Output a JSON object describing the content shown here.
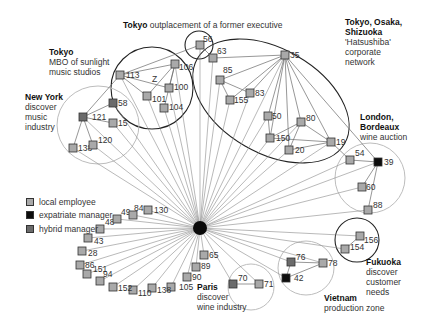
{
  "colors": {
    "local_employee": "#a9a9a9",
    "expatriate_manager": "#0d0d0d",
    "hybrid_manager": "#6b6b6b",
    "edge": "#8a8a8a",
    "region_dark": "#222222",
    "region_light": "#bdbdbd"
  },
  "legend": {
    "items": [
      {
        "type": "local",
        "label": "local employee"
      },
      {
        "type": "expat",
        "label": "expatriate manager"
      },
      {
        "type": "hybrid",
        "label": "hybrid manager"
      }
    ]
  },
  "annotations": {
    "tokyo_outplacement": {
      "place": "Tokyo",
      "text": "outplacement of a former executive"
    },
    "tokyo_mbo": {
      "place": "Tokyo",
      "line1": "MBO of sunlight",
      "line2": "music studios"
    },
    "new_york": {
      "place": "New York",
      "line1": "discover",
      "line2": "music",
      "line3": "industry"
    },
    "hatsushiba": {
      "place_line1": "Tokyo, Osaka,",
      "place_line2": "Shizuoka",
      "line1": "'Hatsushiba'",
      "line2": "corporate",
      "line3": "network"
    },
    "london": {
      "place_line1": "London,",
      "place_line2": "Bordeaux",
      "line1": "wine auction"
    },
    "fukuoka": {
      "place": "Fukuoka",
      "line1": "discover",
      "line2": "customer",
      "line3": "needs"
    },
    "paris": {
      "place": "Paris",
      "line1": "discover",
      "line2": "wine industry"
    },
    "vietnam": {
      "place": "Vietnam",
      "line1": "production zone"
    },
    "cluster_z_label": "Z"
  },
  "hub": {
    "x": 200,
    "y": 228,
    "r": 7
  },
  "regions": [
    {
      "name": "tokyo-outplacement",
      "cx": 199,
      "cy": 45,
      "rx": 14,
      "ry": 14,
      "style": "dark"
    },
    {
      "name": "tokyo-mbo",
      "cx": 152,
      "cy": 88,
      "rx": 41,
      "ry": 41,
      "style": "dark"
    },
    {
      "name": "new-york",
      "cx": 98,
      "cy": 125,
      "rx": 41,
      "ry": 39,
      "style": "light"
    },
    {
      "name": "hatsushiba",
      "cx": 271,
      "cy": 101,
      "rx": 85,
      "ry": 52,
      "rot": 30,
      "style": "dark"
    },
    {
      "name": "london-bordeaux",
      "cx": 370,
      "cy": 178,
      "rx": 35,
      "ry": 35,
      "style": "light"
    },
    {
      "name": "fukuoka",
      "cx": 357,
      "cy": 240,
      "rx": 22,
      "ry": 22,
      "style": "dark"
    },
    {
      "name": "vietnam",
      "cx": 306,
      "cy": 268,
      "rx": 28,
      "ry": 27,
      "style": "light"
    },
    {
      "name": "paris",
      "cx": 251,
      "cy": 287,
      "rx": 23,
      "ry": 23,
      "style": "light"
    }
  ],
  "nodes": [
    {
      "id": "56",
      "x": 200,
      "y": 45,
      "type": "local",
      "lx": 3,
      "ly": -3
    },
    {
      "id": "113",
      "x": 120,
      "y": 75,
      "type": "local",
      "lx": 6,
      "ly": 0
    },
    {
      "id": "106",
      "x": 175,
      "y": 64,
      "type": "local",
      "lx": 4,
      "ly": 6
    },
    {
      "id": "100",
      "x": 169,
      "y": 88,
      "type": "local",
      "lx": 5,
      "ly": 2
    },
    {
      "id": "101",
      "x": 147,
      "y": 96,
      "type": "local",
      "lx": 5,
      "ly": 6
    },
    {
      "id": "104",
      "x": 164,
      "y": 108,
      "type": "local",
      "lx": 5,
      "ly": 2
    },
    {
      "id": "58",
      "x": 113,
      "y": 103,
      "type": "hybrid",
      "lx": 5,
      "ly": 3
    },
    {
      "id": "121",
      "x": 83,
      "y": 117,
      "type": "hybrid",
      "lx": 9,
      "ly": 3
    },
    {
      "id": "15",
      "x": 113,
      "y": 123,
      "type": "local",
      "lx": 5,
      "ly": 3
    },
    {
      "id": "138",
      "x": 73,
      "y": 148,
      "type": "local",
      "lx": 5,
      "ly": 3
    },
    {
      "id": "120",
      "x": 93,
      "y": 145,
      "type": "local",
      "lx": 5,
      "ly": -2
    },
    {
      "id": "63",
      "x": 213,
      "y": 58,
      "type": "local",
      "lx": 4,
      "ly": -4
    },
    {
      "id": "35",
      "x": 285,
      "y": 55,
      "type": "local",
      "lx": 5,
      "ly": 3
    },
    {
      "id": "85",
      "x": 220,
      "y": 80,
      "type": "local",
      "lx": 3,
      "ly": -7
    },
    {
      "id": "83",
      "x": 250,
      "y": 93,
      "type": "local",
      "lx": 5,
      "ly": 3
    },
    {
      "id": "155",
      "x": 230,
      "y": 100,
      "type": "local",
      "lx": 4,
      "ly": 3
    },
    {
      "id": "50",
      "x": 268,
      "y": 116,
      "type": "local",
      "lx": 4,
      "ly": 3
    },
    {
      "id": "80",
      "x": 301,
      "y": 122,
      "type": "local",
      "lx": 5,
      "ly": -1
    },
    {
      "id": "150",
      "x": 270,
      "y": 138,
      "type": "local",
      "lx": 6,
      "ly": 3
    },
    {
      "id": "20",
      "x": 289,
      "y": 150,
      "type": "local",
      "lx": 6,
      "ly": 3
    },
    {
      "id": "19",
      "x": 331,
      "y": 142,
      "type": "local",
      "lx": 5,
      "ly": 0
    },
    {
      "id": "54",
      "x": 350,
      "y": 160,
      "type": "local",
      "lx": 5,
      "ly": -4
    },
    {
      "id": "39",
      "x": 378,
      "y": 162,
      "type": "expat",
      "lx": 6,
      "ly": 0
    },
    {
      "id": "60",
      "x": 362,
      "y": 187,
      "type": "local",
      "lx": 4,
      "ly": 0
    },
    {
      "id": "88",
      "x": 368,
      "y": 210,
      "type": "local",
      "lx": 5,
      "ly": -2
    },
    {
      "id": "156",
      "x": 360,
      "y": 236,
      "type": "local",
      "lx": 4,
      "ly": 7
    },
    {
      "id": "154",
      "x": 345,
      "y": 249,
      "type": "local",
      "lx": 5,
      "ly": 1
    },
    {
      "id": "76",
      "x": 291,
      "y": 262,
      "type": "hybrid",
      "lx": 5,
      "ly": -2
    },
    {
      "id": "78",
      "x": 323,
      "y": 263,
      "type": "local",
      "lx": 5,
      "ly": 3
    },
    {
      "id": "42",
      "x": 286,
      "y": 278,
      "type": "expat",
      "lx": 8,
      "ly": 3
    },
    {
      "id": "70",
      "x": 233,
      "y": 284,
      "type": "hybrid",
      "lx": 5,
      "ly": -3
    },
    {
      "id": "71",
      "x": 259,
      "y": 284,
      "type": "local",
      "lx": 5,
      "ly": 0
    },
    {
      "id": "65",
      "x": 204,
      "y": 255,
      "type": "local",
      "lx": 5,
      "ly": 3
    },
    {
      "id": "89",
      "x": 196,
      "y": 267,
      "type": "local",
      "lx": 5,
      "ly": 2
    },
    {
      "id": "90",
      "x": 187,
      "y": 277,
      "type": "local",
      "lx": 5,
      "ly": 3
    },
    {
      "id": "105",
      "x": 171,
      "y": 287,
      "type": "local",
      "lx": 8,
      "ly": 3
    },
    {
      "id": "138b",
      "label": "138",
      "x": 152,
      "y": 288,
      "type": "local",
      "lx": 5,
      "ly": 5
    },
    {
      "id": "110",
      "x": 133,
      "y": 290,
      "type": "local",
      "lx": 5,
      "ly": 6
    },
    {
      "id": "152",
      "x": 113,
      "y": 287,
      "type": "local",
      "lx": 5,
      "ly": 4
    },
    {
      "id": "94",
      "x": 100,
      "y": 281,
      "type": "local",
      "lx": 3,
      "ly": -4
    },
    {
      "id": "151",
      "x": 87,
      "y": 274,
      "type": "local",
      "lx": 6,
      "ly": -2
    },
    {
      "id": "86",
      "x": 80,
      "y": 265,
      "type": "local",
      "lx": 5,
      "ly": 0
    },
    {
      "id": "28",
      "x": 82,
      "y": 251,
      "type": "local",
      "lx": 6,
      "ly": 5
    },
    {
      "id": "43",
      "x": 88,
      "y": 238,
      "type": "local",
      "lx": 6,
      "ly": 6
    },
    {
      "id": "48",
      "x": 100,
      "y": 229,
      "type": "local",
      "lx": 5,
      "ly": -4
    },
    {
      "id": "49",
      "x": 117,
      "y": 219,
      "type": "local",
      "lx": 4,
      "ly": -4
    },
    {
      "id": "84",
      "x": 133,
      "y": 215,
      "type": "local",
      "lx": 1,
      "ly": -4
    },
    {
      "id": "130",
      "x": 148,
      "y": 210,
      "type": "local",
      "lx": 6,
      "ly": 0
    }
  ],
  "edges": [
    [
      "hub",
      "56"
    ],
    [
      "hub",
      "113"
    ],
    [
      "hub",
      "106"
    ],
    [
      "hub",
      "100"
    ],
    [
      "hub",
      "101"
    ],
    [
      "hub",
      "104"
    ],
    [
      "hub",
      "58"
    ],
    [
      "hub",
      "121"
    ],
    [
      "hub",
      "15"
    ],
    [
      "hub",
      "138"
    ],
    [
      "hub",
      "120"
    ],
    [
      "hub",
      "63"
    ],
    [
      "hub",
      "35"
    ],
    [
      "hub",
      "85"
    ],
    [
      "hub",
      "83"
    ],
    [
      "hub",
      "155"
    ],
    [
      "hub",
      "50"
    ],
    [
      "hub",
      "80"
    ],
    [
      "hub",
      "150"
    ],
    [
      "hub",
      "20"
    ],
    [
      "hub",
      "19"
    ],
    [
      "hub",
      "54"
    ],
    [
      "hub",
      "39"
    ],
    [
      "hub",
      "60"
    ],
    [
      "hub",
      "88"
    ],
    [
      "hub",
      "156"
    ],
    [
      "hub",
      "154"
    ],
    [
      "hub",
      "76"
    ],
    [
      "hub",
      "78"
    ],
    [
      "hub",
      "42"
    ],
    [
      "hub",
      "70"
    ],
    [
      "hub",
      "71"
    ],
    [
      "hub",
      "65"
    ],
    [
      "hub",
      "89"
    ],
    [
      "hub",
      "90"
    ],
    [
      "hub",
      "105"
    ],
    [
      "hub",
      "138b"
    ],
    [
      "hub",
      "110"
    ],
    [
      "hub",
      "152"
    ],
    [
      "hub",
      "94"
    ],
    [
      "hub",
      "151"
    ],
    [
      "hub",
      "86"
    ],
    [
      "hub",
      "28"
    ],
    [
      "hub",
      "43"
    ],
    [
      "hub",
      "48"
    ],
    [
      "hub",
      "49"
    ],
    [
      "hub",
      "84"
    ],
    [
      "hub",
      "130"
    ],
    [
      "113",
      "56"
    ],
    [
      "113",
      "106"
    ],
    [
      "113",
      "100"
    ],
    [
      "113",
      "101"
    ],
    [
      "106",
      "101"
    ],
    [
      "106",
      "100"
    ],
    [
      "106",
      "104"
    ],
    [
      "121",
      "113"
    ],
    [
      "121",
      "58"
    ],
    [
      "121",
      "15"
    ],
    [
      "121",
      "138"
    ],
    [
      "121",
      "120"
    ],
    [
      "35",
      "63"
    ],
    [
      "35",
      "85"
    ],
    [
      "35",
      "83"
    ],
    [
      "35",
      "155"
    ],
    [
      "35",
      "50"
    ],
    [
      "35",
      "80"
    ],
    [
      "35",
      "150"
    ],
    [
      "35",
      "20"
    ],
    [
      "35",
      "19"
    ],
    [
      "35",
      "39"
    ],
    [
      "63",
      "56"
    ],
    [
      "83",
      "85"
    ],
    [
      "85",
      "155"
    ],
    [
      "80",
      "150"
    ],
    [
      "80",
      "20"
    ],
    [
      "50",
      "150"
    ],
    [
      "150",
      "19"
    ],
    [
      "20",
      "19"
    ],
    [
      "80",
      "19"
    ],
    [
      "54",
      "39"
    ],
    [
      "60",
      "39"
    ],
    [
      "88",
      "39"
    ],
    [
      "19",
      "54"
    ],
    [
      "154",
      "156"
    ],
    [
      "42",
      "76"
    ],
    [
      "42",
      "78"
    ],
    [
      "76",
      "78"
    ],
    [
      "70",
      "71"
    ]
  ]
}
